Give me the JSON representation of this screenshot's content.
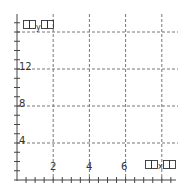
{
  "chart_data": {
    "type": "line",
    "title": "",
    "xlabel": "□□x□□",
    "ylabel": "□□y□□",
    "x_ticks": [
      2,
      4,
      6
    ],
    "y_ticks": [
      4,
      8,
      12
    ],
    "xlim": [
      0,
      8.5
    ],
    "ylim": [
      0,
      17
    ],
    "x_gridlines": [
      2,
      4,
      6,
      8
    ],
    "y_gridlines": [
      4,
      8,
      12,
      16
    ],
    "grid": true,
    "grid_style": "dashed",
    "minor_tick_step": 0.5,
    "series": []
  },
  "labels": {
    "x_axis_letter": "x",
    "y_axis_letter": "y",
    "x_tick_2": "2",
    "x_tick_4": "4",
    "x_tick_6": "6",
    "y_tick_4": "4",
    "y_tick_8": "8",
    "y_tick_12": "12"
  }
}
